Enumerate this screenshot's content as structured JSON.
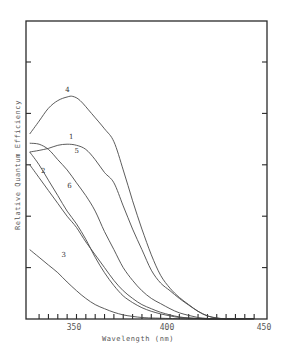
{
  "chart_data": {
    "type": "line",
    "title": "",
    "xlabel": "Wavelength (nm)",
    "ylabel": "Relative Quantum Efficiency",
    "xlim": [
      323,
      452
    ],
    "ylim": [
      0,
      5.8
    ],
    "x_ticks": [
      350,
      400,
      450
    ],
    "x_minor_tick_step": 5,
    "y_ticks_unlabeled": [
      1,
      2,
      3,
      4,
      5
    ],
    "grid": false,
    "legend": "inline curve numbers",
    "series": [
      {
        "name": "1",
        "label_pos": [
          346,
          3.5
        ],
        "x": [
          325,
          330,
          335,
          340,
          345,
          350,
          355,
          360,
          365,
          370,
          375,
          380,
          385,
          390,
          395,
          400,
          405,
          410,
          415,
          420,
          425,
          430
        ],
        "y": [
          3.25,
          3.28,
          3.32,
          3.38,
          3.4,
          3.38,
          3.3,
          3.1,
          2.85,
          2.65,
          2.2,
          1.75,
          1.35,
          0.95,
          0.7,
          0.55,
          0.4,
          0.27,
          0.15,
          0.06,
          0.02,
          0.0
        ]
      },
      {
        "name": "2",
        "label_pos": [
          331,
          2.85
        ],
        "x": [
          325,
          330,
          335,
          340,
          345,
          350,
          355,
          360,
          365,
          370,
          375,
          380,
          385,
          390,
          395,
          400,
          405,
          410,
          415,
          420
        ],
        "y": [
          3.0,
          2.75,
          2.5,
          2.25,
          2.0,
          1.78,
          1.5,
          1.25,
          1.0,
          0.75,
          0.55,
          0.4,
          0.28,
          0.2,
          0.13,
          0.08,
          0.04,
          0.02,
          0.01,
          0.0
        ]
      },
      {
        "name": "3",
        "label_pos": [
          342,
          1.2
        ],
        "x": [
          325,
          330,
          335,
          340,
          345,
          350,
          355,
          360,
          365,
          370,
          375,
          380,
          385,
          390,
          400,
          410
        ],
        "y": [
          1.35,
          1.2,
          1.05,
          0.9,
          0.72,
          0.55,
          0.4,
          0.28,
          0.2,
          0.13,
          0.08,
          0.05,
          0.03,
          0.02,
          0.01,
          0.0
        ]
      },
      {
        "name": "4",
        "label_pos": [
          344,
          4.42
        ],
        "x": [
          325,
          330,
          335,
          340,
          345,
          348,
          352,
          358,
          365,
          370,
          375,
          380,
          385,
          390,
          395,
          400,
          405,
          410,
          415,
          420,
          425,
          430
        ],
        "y": [
          3.6,
          3.85,
          4.1,
          4.25,
          4.32,
          4.33,
          4.25,
          4.0,
          3.7,
          3.45,
          2.9,
          2.3,
          1.75,
          1.25,
          0.85,
          0.6,
          0.42,
          0.28,
          0.15,
          0.06,
          0.02,
          0.0
        ]
      },
      {
        "name": "5",
        "label_pos": [
          349,
          3.22
        ],
        "x": [
          325,
          330,
          335,
          340,
          345,
          350,
          355,
          360,
          365,
          370,
          375,
          380,
          385,
          390,
          395,
          400,
          405,
          410,
          415,
          420,
          425
        ],
        "y": [
          3.42,
          3.4,
          3.3,
          3.1,
          2.9,
          2.65,
          2.4,
          2.1,
          1.7,
          1.35,
          1.0,
          0.75,
          0.55,
          0.4,
          0.3,
          0.2,
          0.12,
          0.07,
          0.03,
          0.01,
          0.0
        ]
      },
      {
        "name": "6",
        "label_pos": [
          345,
          2.55
        ],
        "x": [
          325,
          330,
          335,
          340,
          345,
          350,
          355,
          360,
          365,
          370,
          375,
          380,
          385,
          390,
          395,
          400,
          405,
          410,
          415,
          420
        ],
        "y": [
          3.25,
          3.0,
          2.7,
          2.4,
          2.1,
          1.85,
          1.55,
          1.2,
          0.9,
          0.65,
          0.45,
          0.32,
          0.22,
          0.15,
          0.1,
          0.06,
          0.03,
          0.02,
          0.01,
          0.0
        ]
      }
    ]
  },
  "labels": {
    "x_axis": "Wavelength (nm)",
    "y_axis": "Relative  Quantum  Efficiency",
    "x_tick_350": "350",
    "x_tick_400": "400",
    "x_tick_450": "450"
  }
}
